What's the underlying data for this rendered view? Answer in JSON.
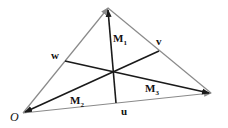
{
  "diagram": {
    "vertices": {
      "O": [
        23,
        113
      ],
      "apex": [
        108,
        8
      ],
      "right": [
        211,
        93
      ]
    },
    "midpoints": {
      "u": [
        116,
        103
      ],
      "v": [
        159,
        51
      ],
      "w": [
        65,
        61
      ]
    },
    "centroid": [
      114,
      72
    ],
    "labels": {
      "O": "O",
      "u": "u",
      "v": "v",
      "w": "w",
      "M1": "M",
      "M1_sub": "1",
      "M2": "M",
      "M2_sub": "2",
      "M3": "M",
      "M3_sub": "3"
    },
    "colors": {
      "sides": "#8a8a8a",
      "medians": "#1a1a1a",
      "background": "#ffffff"
    }
  }
}
